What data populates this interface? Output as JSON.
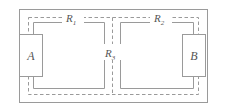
{
  "diagram": {
    "colors": {
      "line": "#9a9a9a",
      "dashed": "#9a9a9a",
      "box_stroke": "#9a9a9a",
      "box_fill": "#ffffff",
      "label": "#555555",
      "background": "#ffffff"
    },
    "labels": {
      "r1": {
        "base": "R",
        "sub": "1"
      },
      "r2": {
        "base": "R",
        "sub": "2"
      },
      "r3": {
        "base": "R",
        "sub": "3"
      },
      "box_a": "A",
      "box_b": "B"
    }
  }
}
